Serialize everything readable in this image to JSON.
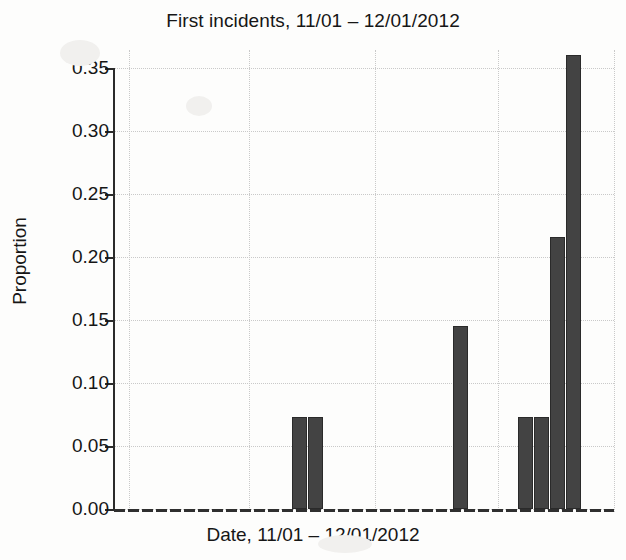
{
  "chart_data": {
    "type": "bar",
    "title": "First incidents, 11/01 – 12/01/2012",
    "xlabel": "Date, 11/01 – 12/01/2012",
    "ylabel": "Proportion",
    "ylim": [
      0.0,
      0.36
    ],
    "xlim": [
      0,
      31
    ],
    "grid": true,
    "legend": false,
    "ytick_labels": [
      "0.00",
      "0.05",
      "0.10",
      "0.15",
      "0.20",
      "0.25",
      "0.30",
      "0.35"
    ],
    "ytick_values": [
      0.0,
      0.05,
      0.1,
      0.15,
      0.2,
      0.25,
      0.3,
      0.35
    ],
    "xtick_labels": [
      "",
      "",
      "",
      "",
      ""
    ],
    "xtick_positions": [
      0.9,
      8.4,
      16.2,
      23.8,
      31.0
    ],
    "bar_color": "#434343",
    "bar_edge_color": "#2a2a2a",
    "grid_color": "#c9c9c9",
    "axis_color": "#2b2b2b",
    "categories": [
      "day-01",
      "day-02",
      "day-03",
      "day-04",
      "day-05",
      "day-06",
      "day-07",
      "day-08",
      "day-09",
      "day-10",
      "day-11",
      "day-12",
      "day-13",
      "day-14",
      "day-15",
      "day-16",
      "day-17",
      "day-18",
      "day-19",
      "day-20",
      "day-21",
      "day-22",
      "day-23",
      "day-24",
      "day-25",
      "day-26",
      "day-27",
      "day-28",
      "day-29",
      "day-30",
      "day-31"
    ],
    "values": [
      0.0,
      0.0,
      0.0,
      0.0,
      0.0,
      0.0,
      0.0,
      0.0,
      0.0,
      0.0,
      0.0,
      0.073,
      0.073,
      0.0,
      0.0,
      0.0,
      0.0,
      0.0,
      0.0,
      0.0,
      0.0,
      0.145,
      0.0,
      0.0,
      0.0,
      0.073,
      0.073,
      0.216,
      0.36,
      0.0,
      0.0
    ],
    "nonzero_bars": [
      {
        "index": 11,
        "value": 0.073
      },
      {
        "index": 12,
        "value": 0.073
      },
      {
        "index": 21,
        "value": 0.145
      },
      {
        "index": 25,
        "value": 0.073
      },
      {
        "index": 26,
        "value": 0.073
      },
      {
        "index": 27,
        "value": 0.216
      },
      {
        "index": 28,
        "value": 0.36
      }
    ]
  }
}
